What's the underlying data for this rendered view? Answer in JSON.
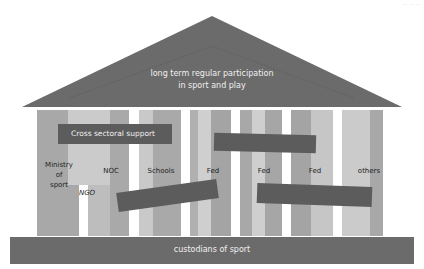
{
  "diagram": {
    "type": "temple-metaphor",
    "corner_mark": "·· ·· ··",
    "roof": {
      "line1": "long term regular participation",
      "line2": "in sport and play",
      "color": "#6b6b6b"
    },
    "columns": [
      {
        "label_lines": [
          "Ministry",
          "of",
          "sport"
        ],
        "sub_label": "NGO"
      },
      {
        "label": "NOC"
      },
      {
        "label": "Schools"
      },
      {
        "label": "Fed"
      },
      {
        "label": "Fed"
      },
      {
        "label": "Fed"
      },
      {
        "label": "others"
      }
    ],
    "bars": [
      {
        "label": "Cross sectoral support"
      },
      {
        "label": ""
      },
      {
        "label": ""
      },
      {
        "label": ""
      }
    ],
    "base": {
      "label": "custodians of sport",
      "color": "#6b6b6b"
    },
    "colors": {
      "bar": "#5c5c5c",
      "stripe_dark": "#a6a6a6",
      "stripe_mid": "#b8b8b8",
      "stripe_light": "#cdcdcd"
    }
  }
}
